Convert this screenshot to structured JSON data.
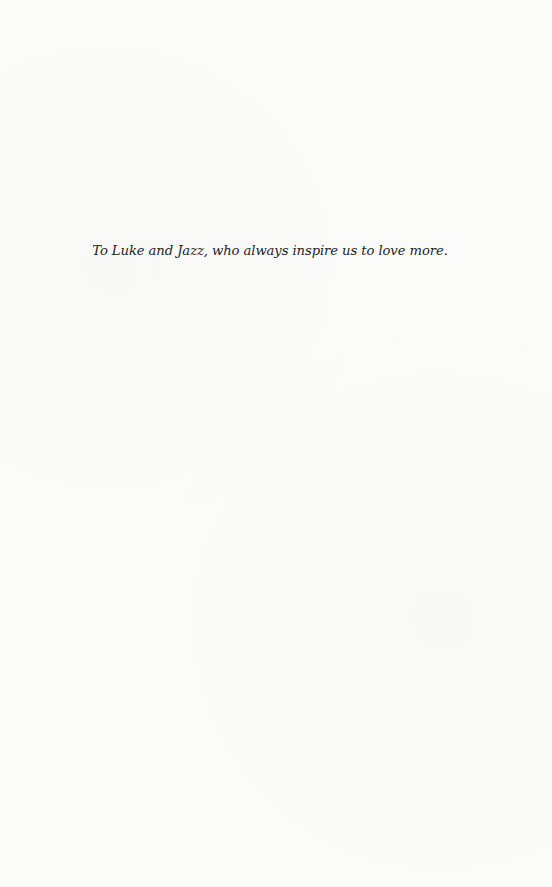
{
  "page": {
    "type": "dedication",
    "background_color": "#fbfbfa",
    "text_color": "#1e1e1e"
  },
  "dedication": {
    "text": "To Luke and Jazz, who always inspire us to love more."
  }
}
